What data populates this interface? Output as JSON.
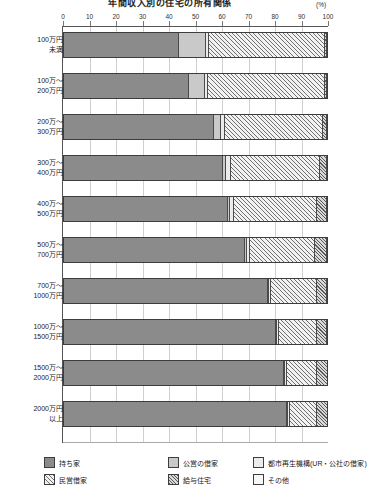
{
  "chart_data": {
    "type": "bar",
    "orientation": "horizontal",
    "stacked": true,
    "title": "年間収入別の住宅の所有関係",
    "unit_label": "(%)",
    "xlabel": "",
    "ylabel": "",
    "xlim": [
      0,
      100
    ],
    "xticks": [
      0,
      10,
      20,
      30,
      40,
      50,
      60,
      70,
      80,
      90,
      100
    ],
    "grid": true,
    "legend_position": "bottom",
    "categories": [
      "100万円\n未満",
      "100万～\n200万円",
      "200万～\n300万円",
      "300万～\n400万円",
      "400万～\n500万円",
      "500万～\n700万円",
      "700万～\n1000万円",
      "1000万～\n1500万円",
      "1500万～\n2000万円",
      "2000万円\n以上"
    ],
    "series": [
      {
        "name": "持ち家",
        "key": "own",
        "values": [
          43.2,
          47.0,
          56.6,
          60.2,
          61.8,
          68.6,
          77.0,
          80.3,
          83.4,
          84.6
        ]
      },
      {
        "name": "公営の借家",
        "key": "public",
        "values": [
          10.4,
          6.2,
          2.6,
          1.2,
          0.8,
          0.5,
          0.3,
          0.2,
          0.2,
          0.2
        ]
      },
      {
        "name": "都市再生機構(UR・公社の借家)",
        "key": "ur",
        "values": [
          1.0,
          1.0,
          1.6,
          1.6,
          1.6,
          1.3,
          0.9,
          0.6,
          0.5,
          0.4
        ]
      },
      {
        "name": "民営借家",
        "key": "private",
        "values": [
          44.4,
          44.8,
          37.2,
          34.0,
          31.8,
          24.8,
          17.4,
          14.5,
          11.7,
          10.6
        ]
      },
      {
        "name": "給与住宅",
        "key": "company",
        "values": [
          0.5,
          0.6,
          1.6,
          2.6,
          3.6,
          4.4,
          4.0,
          4.0,
          3.9,
          3.9
        ]
      },
      {
        "name": "その他",
        "key": "other",
        "values": [
          0.5,
          0.4,
          0.4,
          0.4,
          0.4,
          0.4,
          0.4,
          0.4,
          0.3,
          0.3
        ]
      }
    ],
    "colors": {
      "own": "#8b8b8b",
      "public": "#c9c9c9",
      "ur": "#ececec",
      "private": "#f2f2f2",
      "company": "#d8d8d8",
      "other": "#f7f7f7"
    }
  },
  "legend": {
    "items": [
      {
        "label": "持ち家",
        "key": "own"
      },
      {
        "label": "公営の借家",
        "key": "public"
      },
      {
        "label": "都市再生機構(UR・公社の借家)",
        "key": "ur"
      },
      {
        "label": "民営借家",
        "key": "private"
      },
      {
        "label": "給与住宅",
        "key": "company"
      },
      {
        "label": "その他",
        "key": "other"
      }
    ]
  }
}
